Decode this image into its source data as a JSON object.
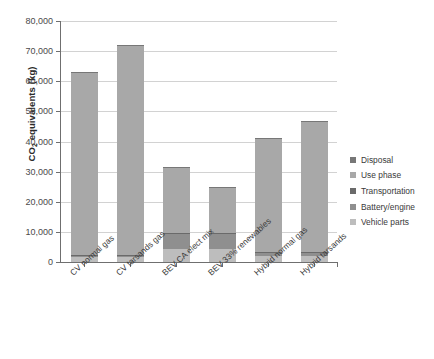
{
  "chart_data": {
    "type": "bar",
    "subtype": "stacked-bar",
    "title": "",
    "xlabel": "",
    "ylabel": "CO2 equivalents (kg)",
    "ylabel_parts": {
      "pre": "CO",
      "sub": "2",
      "post": " equivalents (kg)"
    },
    "ylim": [
      0,
      80000
    ],
    "ytick_step": 10000,
    "ytick_labels": [
      "0",
      "10,000",
      "20,000",
      "30,000",
      "40,000",
      "50,000",
      "60,000",
      "70,000",
      "80,000"
    ],
    "ytick_values": [
      0,
      10000,
      20000,
      30000,
      40000,
      50000,
      60000,
      70000,
      80000
    ],
    "grid": true,
    "grid_axis": "y",
    "legend_position": "right",
    "categories": [
      "CV normal gas",
      "CV tarsands gas",
      "BEV CA elect mix",
      "BEV 33% renewables",
      "Hybrid normal gas",
      "Hybrid tarsands"
    ],
    "series": [
      {
        "name": "Vehicle parts",
        "color": "#bdbdbd",
        "values": [
          1500,
          1500,
          4200,
          4200,
          1900,
          1900
        ]
      },
      {
        "name": "Battery/engine",
        "color": "#8f8f8f",
        "values": [
          400,
          400,
          5100,
          5100,
          1100,
          1100
        ]
      },
      {
        "name": "Transportation",
        "color": "#6a6a6a",
        "values": [
          300,
          300,
          350,
          350,
          300,
          300
        ]
      },
      {
        "name": "Use phase",
        "color": "#a8a8a8",
        "values": [
          60500,
          69700,
          21700,
          14900,
          37600,
          43400
        ]
      },
      {
        "name": "Disposal",
        "color": "#777777",
        "values": [
          100,
          100,
          150,
          150,
          100,
          100
        ]
      }
    ],
    "totals": [
      62800,
      72000,
      31500,
      24700,
      41000,
      46800
    ],
    "legend_order_displayed": [
      "Disposal",
      "Use phase",
      "Transportation",
      "Battery/engine",
      "Vehicle parts"
    ]
  },
  "legend": {
    "items": [
      {
        "label": "Disposal",
        "color": "#777777"
      },
      {
        "label": "Use phase",
        "color": "#a8a8a8"
      },
      {
        "label": "Transportation",
        "color": "#6a6a6a"
      },
      {
        "label": "Battery/engine",
        "color": "#8f8f8f"
      },
      {
        "label": "Vehicle parts",
        "color": "#bdbdbd"
      }
    ]
  }
}
